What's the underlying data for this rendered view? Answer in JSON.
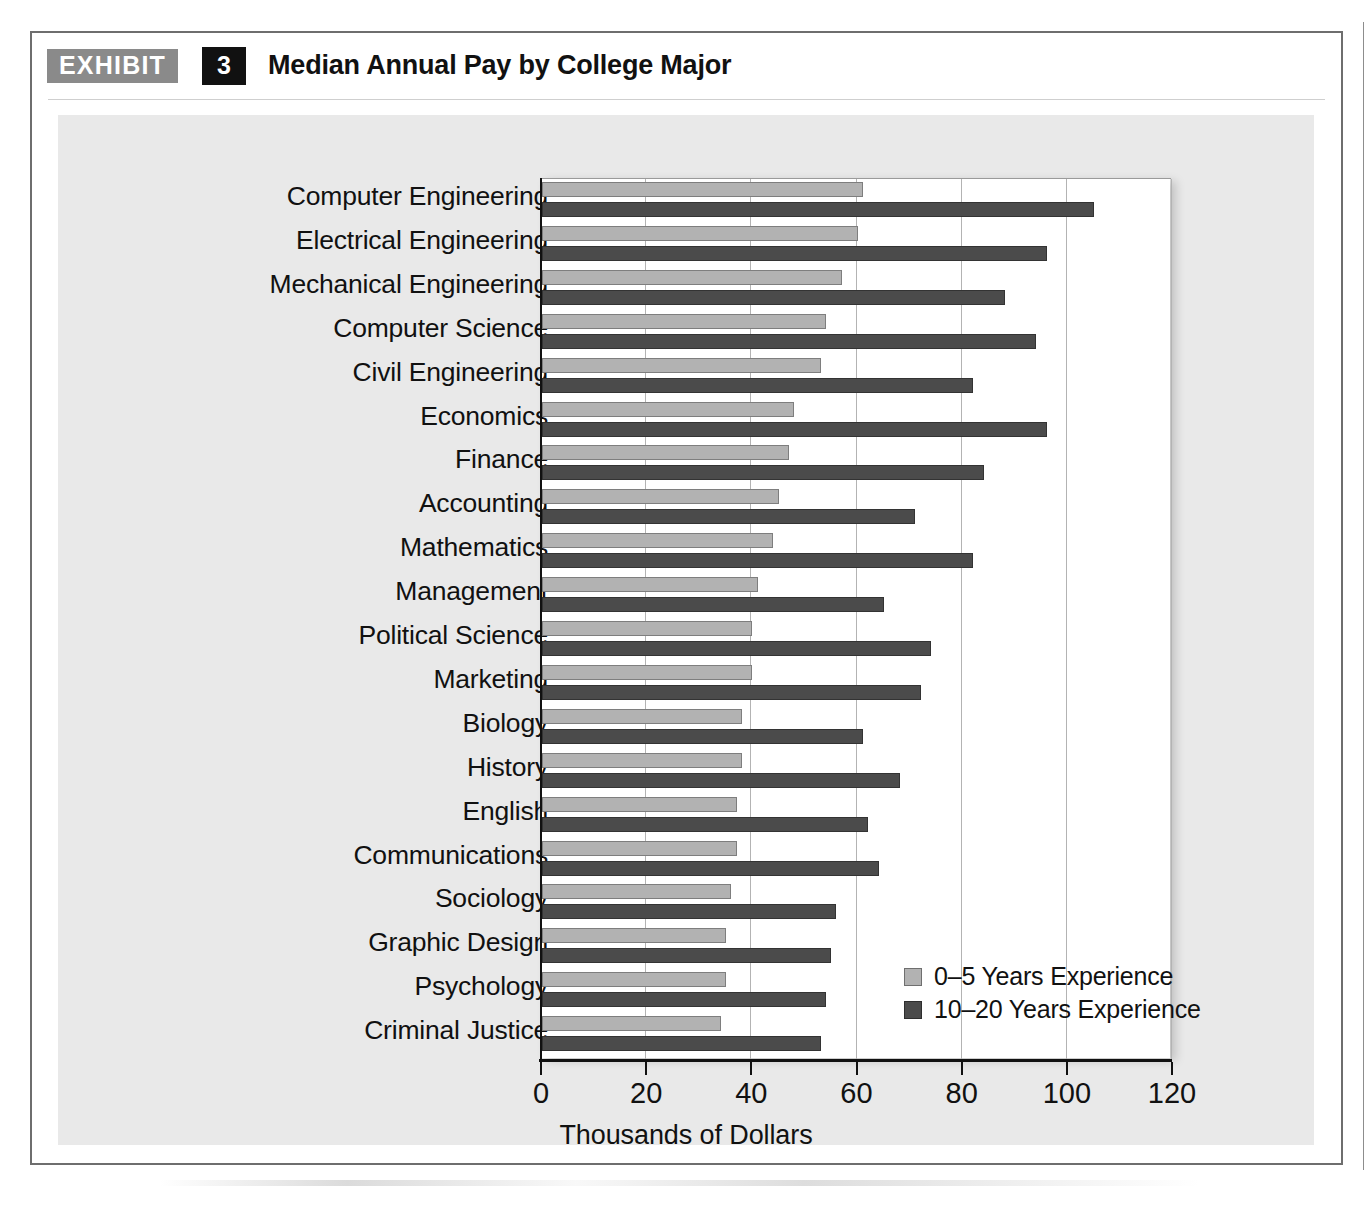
{
  "exhibit": {
    "badge_label": "EXHIBIT",
    "number": "3",
    "title": "Median Annual Pay by College Major"
  },
  "colors": {
    "series_light": "#b2b2b2",
    "series_dark": "#4b4b4b",
    "badge_bg": "#8a8a8a",
    "number_bg": "#111111",
    "panel_bg": "#e9e9e9",
    "plot_bg": "#ffffff",
    "gridline": "#b3b3b3",
    "axis": "#111111"
  },
  "legend": {
    "position": "inside-bottom-right",
    "entries": [
      {
        "label": "0–5 Years Experience",
        "swatch": "light"
      },
      {
        "label": "10–20 Years Experience",
        "swatch": "dark"
      }
    ]
  },
  "xaxis": {
    "title": "Thousands of Dollars",
    "ticks": [
      "0",
      "20",
      "40",
      "60",
      "80",
      "100",
      "120"
    ],
    "min": 0,
    "max": 120,
    "step": 20
  },
  "chart_data": {
    "type": "bar",
    "orientation": "horizontal",
    "title": "Median Annual Pay by College Major",
    "xlabel": "Thousands of Dollars",
    "ylabel": "",
    "xlim": [
      0,
      120
    ],
    "xticks": [
      0,
      20,
      40,
      60,
      80,
      100,
      120
    ],
    "grid": "vertical",
    "legend_position": "inside-bottom-right",
    "units": "thousands of USD",
    "categories": [
      "Computer Engineering",
      "Electrical Engineering",
      "Mechanical Engineering",
      "Computer Science",
      "Civil Engineering",
      "Economics",
      "Finance",
      "Accounting",
      "Mathematics",
      "Management",
      "Political Science",
      "Marketing",
      "Biology",
      "History",
      "English",
      "Communications",
      "Sociology",
      "Graphic Design",
      "Psychology",
      "Criminal Justice"
    ],
    "series": [
      {
        "name": "0–5 Years Experience",
        "color": "#b2b2b2",
        "values": [
          61,
          60,
          57,
          54,
          53,
          48,
          47,
          45,
          44,
          41,
          40,
          40,
          38,
          38,
          37,
          37,
          36,
          35,
          35,
          34
        ]
      },
      {
        "name": "10–20 Years Experience",
        "color": "#4b4b4b",
        "values": [
          105,
          96,
          88,
          94,
          82,
          96,
          84,
          71,
          82,
          65,
          74,
          72,
          61,
          68,
          62,
          64,
          56,
          55,
          54,
          53
        ]
      }
    ]
  }
}
